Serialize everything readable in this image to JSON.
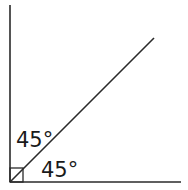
{
  "diagram": {
    "stroke_color": "#2a2a2a",
    "labels": {
      "upper_angle": "45°",
      "lower_angle": "45°"
    },
    "right_angle_marker": true
  }
}
